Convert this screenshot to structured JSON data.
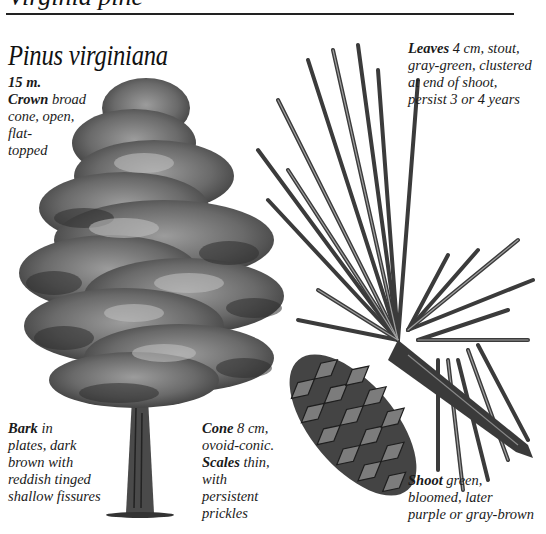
{
  "header": {
    "partial_heading": "Virginia pine",
    "circle_count": 5
  },
  "species": {
    "scientific_name": "Pinus virginiana"
  },
  "annotations": {
    "height": {
      "value": "15 m."
    },
    "crown": {
      "term": "Crown",
      "text_lines": [
        "broad",
        "cone, open,",
        "flat-",
        "topped"
      ]
    },
    "leaves": {
      "term": "Leaves",
      "text_lines": [
        "4 cm, stout,",
        "gray-green, clustered",
        "at end of shoot,",
        "persist 3 or 4 years"
      ]
    },
    "bark": {
      "term": "Bark",
      "text_lines": [
        "in",
        "plates, dark",
        "brown with",
        "reddish tinged",
        "shallow fissures"
      ]
    },
    "cone": {
      "term": "Cone",
      "text_lines": [
        "8 cm,",
        "ovoid-conic."
      ]
    },
    "scales": {
      "term": "Scales",
      "text_lines": [
        "thin,",
        "with",
        "persistent",
        "prickles"
      ]
    },
    "shoot": {
      "term": "Shoot",
      "text_lines": [
        "green,",
        "bloomed, later",
        "purple or gray-brown"
      ]
    }
  },
  "illustrations": {
    "tree": "whole-tree-illustration",
    "shoot": "needle-cluster-and-cone-illustration"
  },
  "colors": {
    "ink": "#161616",
    "foliage_dark": "#3a3a3a",
    "foliage_mid": "#6e6e6e",
    "foliage_light": "#a8a8a8",
    "paper": "#ffffff"
  }
}
